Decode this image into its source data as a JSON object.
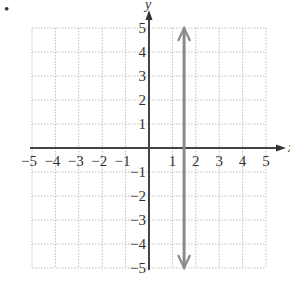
{
  "bullet": "•",
  "chart_data": {
    "type": "line",
    "title": "",
    "xlabel": "x",
    "ylabel": "y",
    "xlim": [
      -5,
      5
    ],
    "ylim": [
      -5,
      5
    ],
    "grid": true,
    "x_ticks": [
      -5,
      -4,
      -3,
      -2,
      -1,
      1,
      2,
      3,
      4,
      5
    ],
    "y_ticks": [
      5,
      4,
      3,
      2,
      1,
      -1,
      -2,
      -3,
      -4,
      -5
    ],
    "x_tick_labels": [
      "−5",
      "−4",
      "−3",
      "−2",
      "−1",
      "1",
      "2",
      "3",
      "4",
      "5"
    ],
    "y_tick_labels": [
      "5",
      "4",
      "3",
      "2",
      "1",
      "−1",
      "−2",
      "−3",
      "−4",
      "−5"
    ],
    "series": [
      {
        "name": "vertical line x = 1.5",
        "x": [
          1.5,
          1.5
        ],
        "y": [
          -5,
          5
        ],
        "arrows": "both",
        "color": "#8a8a8a"
      }
    ]
  }
}
